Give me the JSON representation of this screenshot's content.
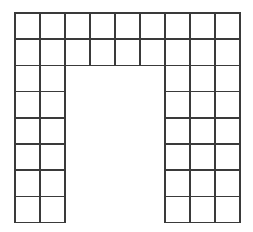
{
  "canvas": {
    "width": 253,
    "height": 232,
    "background_color": "#ffffff"
  },
  "figure": {
    "shape_name": "arch",
    "line_color": "#3a3a3a",
    "fill_color": "#ffffff",
    "stroke_width": 1.6,
    "grid": {
      "columns": 9,
      "rows": 8,
      "cell_width": 25,
      "cell_height": 26.2,
      "origin_x": 15,
      "origin_y": 13
    },
    "counts": {
      "total_cells": 48,
      "top_band_cells": 18,
      "left_leg_cells": 12,
      "right_leg_cells": 18
    },
    "legs": {
      "left_columns": [
        1,
        2
      ],
      "right_columns": [
        7,
        8,
        9
      ],
      "leg_start_row": 3,
      "leg_end_row": 8
    },
    "opening": {
      "columns": [
        3,
        4,
        5,
        6
      ],
      "rows": [
        3,
        4,
        5,
        6,
        7,
        8
      ],
      "filled": false
    },
    "filled_cells": [
      [
        1,
        1
      ],
      [
        2,
        1
      ],
      [
        3,
        1
      ],
      [
        4,
        1
      ],
      [
        5,
        1
      ],
      [
        6,
        1
      ],
      [
        7,
        1
      ],
      [
        8,
        1
      ],
      [
        9,
        1
      ],
      [
        1,
        2
      ],
      [
        2,
        2
      ],
      [
        3,
        2
      ],
      [
        4,
        2
      ],
      [
        5,
        2
      ],
      [
        6,
        2
      ],
      [
        7,
        2
      ],
      [
        8,
        2
      ],
      [
        9,
        2
      ],
      [
        1,
        3
      ],
      [
        2,
        3
      ],
      [
        7,
        3
      ],
      [
        8,
        3
      ],
      [
        9,
        3
      ],
      [
        1,
        4
      ],
      [
        2,
        4
      ],
      [
        7,
        4
      ],
      [
        8,
        4
      ],
      [
        9,
        4
      ],
      [
        1,
        5
      ],
      [
        2,
        5
      ],
      [
        7,
        5
      ],
      [
        8,
        5
      ],
      [
        9,
        5
      ],
      [
        1,
        6
      ],
      [
        2,
        6
      ],
      [
        7,
        6
      ],
      [
        8,
        6
      ],
      [
        9,
        6
      ],
      [
        1,
        7
      ],
      [
        2,
        7
      ],
      [
        7,
        7
      ],
      [
        8,
        7
      ],
      [
        9,
        7
      ],
      [
        1,
        8
      ],
      [
        2,
        8
      ],
      [
        7,
        8
      ],
      [
        8,
        8
      ],
      [
        9,
        8
      ]
    ]
  }
}
